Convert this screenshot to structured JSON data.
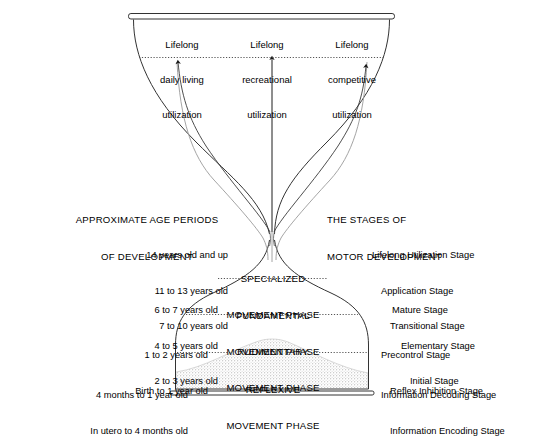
{
  "diagram": {
    "title_hidden": "Hourglass model of motor development",
    "top_labels": [
      {
        "line1": "Lifelong",
        "line2": "daily living",
        "line3": "utilization"
      },
      {
        "line1": "Lifelong",
        "line2": "recreational",
        "line3": "utilization"
      },
      {
        "line1": "Lifelong",
        "line2": "competitive",
        "line3": "utilization"
      }
    ],
    "left_heading": {
      "line1": "APPROXIMATE AGE PERIODS",
      "line2": "OF DEVELOPMENT"
    },
    "right_heading": {
      "line1": "THE STAGES OF",
      "line2": "MOTOR DEVELOPMENT"
    },
    "age_groups": [
      {
        "lines": [
          "14 years old and up",
          "11 to 13 years old",
          "7 to 10 years old"
        ]
      },
      {
        "lines": [
          "6 to 7 years old",
          "4 to 5 years old",
          "2 to 3 years old"
        ]
      },
      {
        "lines": [
          "1 to 2 years old",
          "Birth to 1 year old"
        ]
      },
      {
        "lines": [
          "4 months to 1 year old",
          "In utero to 4 months old"
        ]
      }
    ],
    "phases": [
      {
        "line1": "SPECIALIZED",
        "line2": "MOVEMENT PHASE"
      },
      {
        "line1": "FUNDAMENTAL",
        "line2": "MOVEMENT PHASE"
      },
      {
        "line1": "RUDIMENTARY",
        "line2": "MOVEMENT PHASE"
      },
      {
        "line1": "REFLEXIVE",
        "line2": "MOVEMENT PHASE"
      }
    ],
    "stage_groups": [
      {
        "lines": [
          "Lifelong Utilization Stage",
          "Application Stage",
          "Transitional Stage"
        ]
      },
      {
        "lines": [
          "Mature Stage",
          "Elementary Stage",
          "Initial Stage"
        ]
      },
      {
        "lines": [
          "Precontrol Stage",
          "Reflex Inhibition Stage"
        ]
      },
      {
        "lines": [
          "Information Decoding Stage",
          "Information Encoding Stage"
        ]
      }
    ],
    "colors": {
      "ink": "#1a1a1a",
      "line": "#333333",
      "sand": "#b8b8b8",
      "dotted": "#555555"
    }
  }
}
